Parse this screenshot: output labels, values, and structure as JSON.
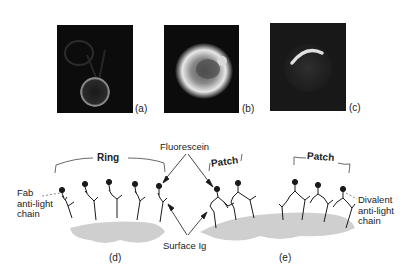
{
  "figure": {
    "micrographs": [
      {
        "id": "a",
        "label": "(a)",
        "description": "ring-stained cell"
      },
      {
        "id": "b",
        "label": "(b)",
        "description": "uniformly bright cell"
      },
      {
        "id": "c",
        "label": "(c)",
        "description": "cap/patch on one side"
      }
    ],
    "diagram": {
      "panels": [
        {
          "id": "d",
          "label": "(d)",
          "bracket_label": "Ring"
        },
        {
          "id": "e",
          "label": "(e)",
          "bracket_labels": [
            "Patch",
            "Patch"
          ]
        }
      ],
      "annotations": {
        "fluorescein": "Fluorescein",
        "surface_ig": "Surface Ig",
        "fab_line1": "Fab",
        "fab_line2": "anti-light",
        "fab_line3": "chain",
        "divalent_line1": "Divalent",
        "divalent_line2": "anti-light",
        "divalent_line3": "chain"
      },
      "colors": {
        "membrane": "#cfcfcf",
        "ink": "#1a1a1a"
      }
    }
  }
}
